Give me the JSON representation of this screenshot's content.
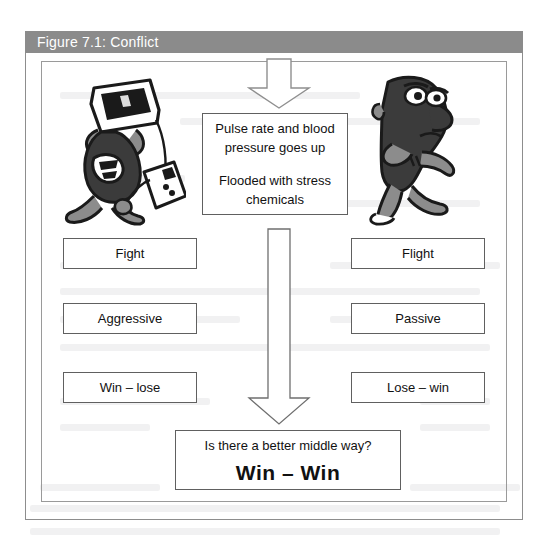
{
  "figure": {
    "caption": "Figure 7.1: Conflict",
    "caption_bar_color": "#8b8b8b",
    "caption_text_color": "#ffffff",
    "frame_border_color": "#8d8d8d"
  },
  "stress_box": {
    "line_1": "Pulse rate and blood",
    "line_2": "pressure goes up",
    "line_3": "Flooded with stress",
    "line_4": "chemicals"
  },
  "left_column": {
    "response": "Fight",
    "style": "Aggressive",
    "outcome": "Win – lose"
  },
  "right_column": {
    "response": "Flight",
    "style": "Passive",
    "outcome": "Lose – win"
  },
  "outcome_box": {
    "question": "Is there a better middle way?",
    "answer": "Win – Win"
  },
  "icons": {
    "arrow_top": "down-arrow-icon",
    "arrow_long": "down-arrow-icon",
    "toon_left": "angry-person-smashing-computer-illustration",
    "toon_right": "timid-person-sneaking-away-illustration"
  }
}
